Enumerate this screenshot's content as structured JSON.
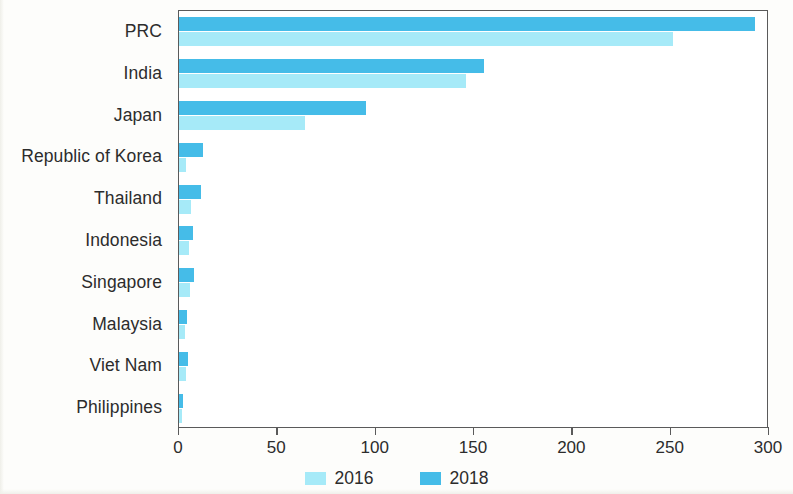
{
  "chart_data": {
    "type": "bar",
    "orientation": "horizontal",
    "title": "",
    "subtitle": "",
    "xlabel": "",
    "ylabel": "",
    "xlim": [
      0,
      300
    ],
    "ylim": null,
    "grid": false,
    "legend_position": "bottom-center",
    "categories": [
      "PRC",
      "India",
      "Japan",
      "Republic of Korea",
      "Thailand",
      "Indonesia",
      "Singapore",
      "Malaysia",
      "Viet Nam",
      "Philippines"
    ],
    "xticks": [
      0,
      50,
      100,
      150,
      200,
      250,
      300
    ],
    "xticklabels": [
      "0",
      "50",
      "100",
      "150",
      "200",
      "250",
      "300"
    ],
    "series": [
      {
        "name": "2018",
        "color": "#45bce8",
        "values": [
          293,
          155,
          95,
          12,
          11,
          7,
          7.5,
          4,
          4.5,
          2
        ]
      },
      {
        "name": "2016",
        "color": "#a6eaf8",
        "values": [
          251,
          146,
          64,
          3.5,
          6,
          5,
          5.5,
          3,
          3.5,
          1.5
        ]
      }
    ]
  },
  "legend": {
    "items": [
      {
        "label": "2016",
        "color": "#a6eaf8"
      },
      {
        "label": "2018",
        "color": "#45bce8"
      }
    ]
  }
}
